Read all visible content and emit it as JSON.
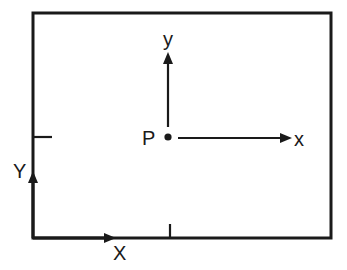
{
  "diagram": {
    "title": "",
    "frame_labels": {
      "global_x": "X",
      "global_y": "Y"
    },
    "point": {
      "label": "P"
    },
    "local_axes": {
      "x_label": "x",
      "y_label": "y"
    },
    "colors": {
      "ink": "#1a1a1a",
      "background": "#ffffff"
    }
  }
}
